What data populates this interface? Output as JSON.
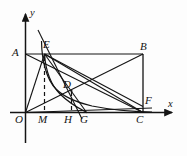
{
  "figure": {
    "type": "geometry-diagram",
    "background_color": "#fdfdfd",
    "stroke_color": "#141414"
  },
  "axes": {
    "x_label": "x",
    "y_label": "y",
    "origin_label": "O",
    "x_axis": {
      "x1": 10,
      "y1": 112.5,
      "x2": 176,
      "y2": 112.5
    },
    "y_axis": {
      "x1": 25.5,
      "y1": 143,
      "x2": 25.5,
      "y2": 11
    }
  },
  "points": [
    {
      "name": "O",
      "label": "O",
      "x": 25.5,
      "y": 112.5,
      "label_x": 16,
      "label_y": 116,
      "kind": "origin"
    },
    {
      "name": "M",
      "label": "M",
      "x": 44.5,
      "y": 112.5,
      "label_x": 39,
      "label_y": 116,
      "kind": "foot"
    },
    {
      "name": "H",
      "label": "H",
      "x": 71.5,
      "y": 112.5,
      "label_x": 65,
      "label_y": 116,
      "kind": "foot"
    },
    {
      "name": "G",
      "label": "G",
      "x": 87,
      "y": 112.5,
      "label_x": 81,
      "label_y": 116,
      "kind": "curve-end"
    },
    {
      "name": "C",
      "label": "C",
      "x": 143,
      "y": 112.5,
      "label_x": 137,
      "label_y": 116,
      "kind": "vertex"
    },
    {
      "name": "A",
      "label": "A",
      "x": 25.5,
      "y": 54,
      "label_x": 13,
      "label_y": 50,
      "kind": "vertex"
    },
    {
      "name": "B",
      "label": "B",
      "x": 143,
      "y": 54,
      "label_x": 141,
      "label_y": 48,
      "kind": "vertex"
    },
    {
      "name": "E",
      "label": "E",
      "x": 44.5,
      "y": 54,
      "label_x": 42,
      "label_y": 45,
      "kind": "on-curve"
    },
    {
      "name": "D",
      "label": "D",
      "x": 71.5,
      "y": 91,
      "label_x": 64,
      "label_y": 87,
      "kind": "on-curve"
    },
    {
      "name": "F",
      "label": "F",
      "x": 143,
      "y": 106,
      "label_x": 145,
      "label_y": 102,
      "kind": "on-line"
    }
  ],
  "segments": [
    {
      "name": "rectangle-top-AB",
      "from": "A",
      "to": "B",
      "style": "solid"
    },
    {
      "name": "rectangle-right-BC",
      "from": "B",
      "to": "C",
      "style": "solid"
    },
    {
      "name": "diagonal-A-C",
      "from": "A",
      "to": "C",
      "style": "solid"
    },
    {
      "name": "diagonal-O-B",
      "from": "O",
      "to": "B",
      "style": "solid"
    },
    {
      "name": "line-O-E",
      "from": "O",
      "to": "E",
      "style": "solid"
    },
    {
      "name": "line-E-C",
      "from": "E",
      "to": "C",
      "style": "solid"
    },
    {
      "name": "line-E-G",
      "from": "E",
      "to": "G",
      "style": "solid"
    },
    {
      "name": "line-O-D-B",
      "from": "O",
      "to": "B",
      "style": "solid"
    },
    {
      "name": "line-E-F",
      "from": "E",
      "to": "F",
      "style": "solid"
    },
    {
      "name": "line-O-F",
      "from": "O",
      "to": "F",
      "style": "solid"
    },
    {
      "name": "steep-line-through-E",
      "from": "above-E",
      "to": "below-G",
      "style": "solid"
    },
    {
      "name": "dashed-E-M",
      "from": "E",
      "to": "M",
      "style": "dashed"
    },
    {
      "name": "dashed-D-H",
      "from": "D",
      "to": "H",
      "style": "dashed"
    }
  ],
  "curve": {
    "name": "hyperbola-branch",
    "through_points": [
      "E",
      "D",
      "G"
    ],
    "style": "solid"
  }
}
